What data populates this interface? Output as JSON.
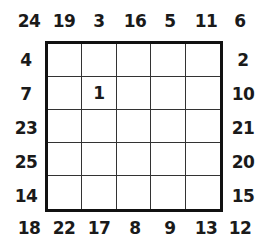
{
  "puzzle": {
    "rows": 5,
    "cols": 5,
    "top_clues": [
      "19",
      "3",
      "16",
      "5",
      "11"
    ],
    "bottom_clues": [
      "22",
      "17",
      "8",
      "9",
      "13"
    ],
    "left_clues": [
      "4",
      "7",
      "23",
      "25",
      "14"
    ],
    "right_clues": [
      "2",
      "10",
      "21",
      "20",
      "15"
    ],
    "corners": {
      "top_left": "24",
      "top_right": "6",
      "bottom_left": "18",
      "bottom_right": "12"
    },
    "cells": [
      [
        "",
        "",
        "",
        "",
        ""
      ],
      [
        "",
        "1",
        "",
        "",
        ""
      ],
      [
        "",
        "",
        "",
        "",
        ""
      ],
      [
        "",
        "",
        "",
        "",
        ""
      ],
      [
        "",
        "",
        "",
        "",
        ""
      ]
    ]
  }
}
